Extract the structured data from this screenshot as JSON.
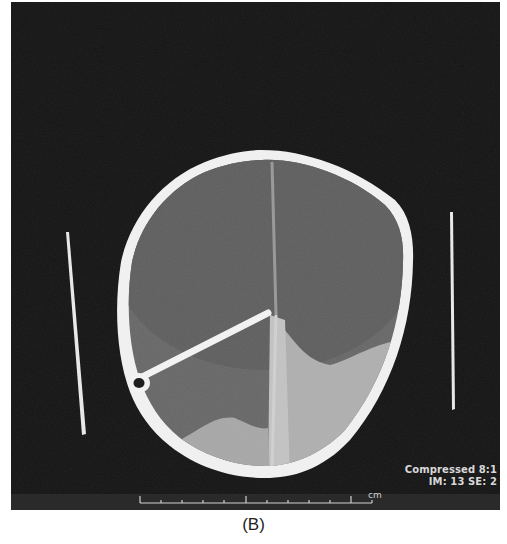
{
  "figure": {
    "caption": "(B)",
    "modality": "CT axial head",
    "overlay": {
      "line1": "Compressed 8:1",
      "line2": "IM: 13 SE: 2"
    },
    "scale_bar": {
      "unit": "cm",
      "tick_count": 12
    }
  },
  "colors": {
    "background": "#141414",
    "bone": "#f2f2f2",
    "brain": "#6b6b6b",
    "hemorrhage": "#b8b8b8",
    "caption": "#222222"
  }
}
